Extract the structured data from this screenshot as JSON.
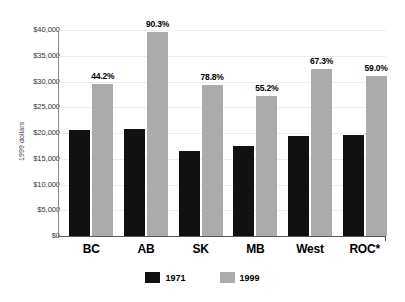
{
  "chart_data": {
    "type": "bar",
    "title": "",
    "xlabel": "",
    "ylabel": "1999 dollars",
    "ylim": [
      0,
      40000
    ],
    "ytick_labels": [
      "$0",
      "$5,000",
      "$10,000",
      "$15,000",
      "$20,000",
      "$25,000",
      "$30,000",
      "$35,000",
      "$40,000"
    ],
    "ytick_values": [
      0,
      5000,
      10000,
      15000,
      20000,
      25000,
      30000,
      35000,
      40000
    ],
    "grid": true,
    "legend_position": "bottom-center",
    "categories": [
      "BC",
      "AB",
      "SK",
      "MB",
      "West",
      "ROC*"
    ],
    "series": [
      {
        "name": "1971",
        "color": "#111111",
        "values": [
          20500,
          20800,
          16500,
          17500,
          19400,
          19600
        ]
      },
      {
        "name": "1999",
        "color": "#ababab",
        "values": [
          29600,
          39600,
          29400,
          27200,
          32400,
          31100
        ]
      }
    ],
    "annotations": [
      "44.2%",
      "90.3%",
      "78.8%",
      "55.2%",
      "67.3%",
      "59.0%"
    ]
  }
}
